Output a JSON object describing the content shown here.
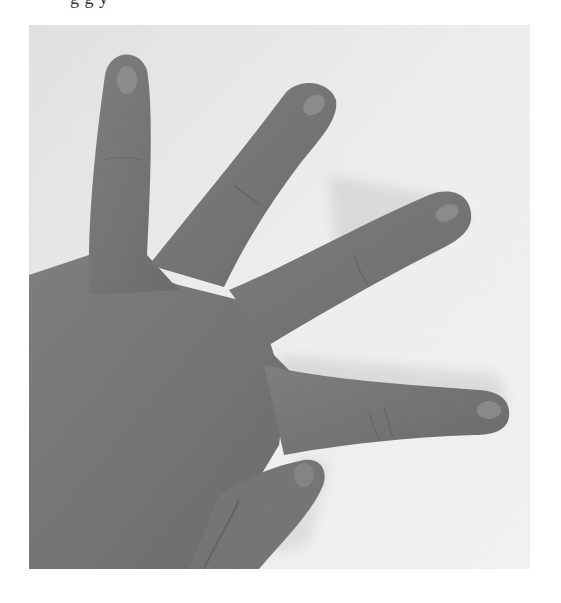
{
  "page": {
    "top_text_fragment": "g g   y",
    "background": "#ffffff"
  },
  "photo": {
    "subject": "hand showing four spread fingers with thumb folded",
    "style": "grayscale",
    "colors": {
      "background_light": "#ededed",
      "background_shadow": "#dcdcdc",
      "skin": "#7a7a7a",
      "skin_dark": "#5e5e5e",
      "skin_highlight": "#9a9a9a",
      "crease": "#555555"
    }
  }
}
